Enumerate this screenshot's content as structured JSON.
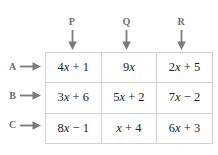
{
  "table": {
    "column_headers": [
      {
        "label": "P",
        "arrow": "down-arrow-icon"
      },
      {
        "label": "Q",
        "arrow": "down-arrow-icon"
      },
      {
        "label": "R",
        "arrow": "down-arrow-icon"
      }
    ],
    "row_headers": [
      {
        "label": "A",
        "arrow": "right-arrow-icon"
      },
      {
        "label": "B",
        "arrow": "right-arrow-icon"
      },
      {
        "label": "C",
        "arrow": "right-arrow-icon"
      }
    ],
    "rows": [
      [
        "4x + 1",
        "9x",
        "2x + 5"
      ],
      [
        "3x + 6",
        "5x + 2",
        "7x − 2"
      ],
      [
        "8x − 1",
        "x + 4",
        "6x + 3"
      ]
    ]
  },
  "colors": {
    "cell_text": "#232323",
    "header_text": "#6e6e6e",
    "grid_line": "#d2d2d2",
    "arrow": "#7a7a7a",
    "background": "#ffffff"
  },
  "chart_data": {
    "type": "table",
    "title": "",
    "columns": [
      "P",
      "Q",
      "R"
    ],
    "row_labels": [
      "A",
      "B",
      "C"
    ],
    "cells": [
      [
        "4x + 1",
        "9x",
        "2x + 5"
      ],
      [
        "3x + 6",
        "5x + 2",
        "7x − 2"
      ],
      [
        "8x − 1",
        "x + 4",
        "6x + 3"
      ]
    ]
  }
}
